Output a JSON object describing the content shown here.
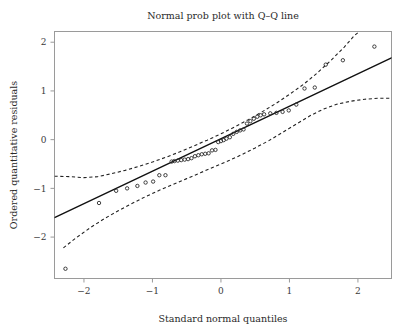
{
  "chart_data": {
    "type": "scatter",
    "title": "Normal prob plot with Q–Q line",
    "xlabel": "Standard normal quantiles",
    "ylabel": "Ordered quantitative residuals",
    "xlim": [
      -2.43,
      2.49
    ],
    "ylim": [
      -2.85,
      2.22
    ],
    "xticks": [
      -2,
      -1,
      0,
      1,
      2
    ],
    "xticklabels": [
      "−2",
      "−1",
      "0",
      "1",
      "2"
    ],
    "yticks": [
      2,
      1,
      0,
      -1,
      -2
    ],
    "yticklabels": [
      "2",
      "1",
      "0",
      "−1",
      "−2"
    ],
    "grid": false,
    "legend": false,
    "marker": "open-circle",
    "marker_size_px": 3.4,
    "series": [
      {
        "name": "Ordered residuals vs normal quantiles",
        "type": "scatter",
        "points": [
          [
            -2.27,
            -2.65
          ],
          [
            -1.78,
            -1.3
          ],
          [
            -1.53,
            -1.05
          ],
          [
            -1.37,
            -1.0
          ],
          [
            -1.22,
            -0.95
          ],
          [
            -1.1,
            -0.88
          ],
          [
            -0.99,
            -0.86
          ],
          [
            -0.9,
            -0.73
          ],
          [
            -0.81,
            -0.73
          ],
          [
            -0.72,
            -0.45
          ],
          [
            -0.68,
            -0.44
          ],
          [
            -0.63,
            -0.43
          ],
          [
            -0.58,
            -0.42
          ],
          [
            -0.53,
            -0.41
          ],
          [
            -0.48,
            -0.4
          ],
          [
            -0.43,
            -0.38
          ],
          [
            -0.38,
            -0.34
          ],
          [
            -0.33,
            -0.32
          ],
          [
            -0.28,
            -0.3
          ],
          [
            -0.23,
            -0.29
          ],
          [
            -0.18,
            -0.28
          ],
          [
            -0.13,
            -0.22
          ],
          [
            -0.08,
            -0.21
          ],
          [
            -0.04,
            -0.05
          ],
          [
            0.0,
            -0.03
          ],
          [
            0.04,
            -0.01
          ],
          [
            0.08,
            0.02
          ],
          [
            0.13,
            0.05
          ],
          [
            0.18,
            0.12
          ],
          [
            0.23,
            0.16
          ],
          [
            0.28,
            0.19
          ],
          [
            0.33,
            0.21
          ],
          [
            0.38,
            0.33
          ],
          [
            0.43,
            0.38
          ],
          [
            0.48,
            0.43
          ],
          [
            0.53,
            0.47
          ],
          [
            0.58,
            0.5
          ],
          [
            0.63,
            0.52
          ],
          [
            0.72,
            0.54
          ],
          [
            0.81,
            0.55
          ],
          [
            0.9,
            0.57
          ],
          [
            0.99,
            0.6
          ],
          [
            1.1,
            0.72
          ],
          [
            1.22,
            1.05
          ],
          [
            1.37,
            1.07
          ],
          [
            1.53,
            1.54
          ],
          [
            1.78,
            1.63
          ],
          [
            2.24,
            1.91
          ]
        ]
      },
      {
        "name": "Q–Q reference line",
        "type": "line",
        "style": "solid",
        "endpoints": [
          [
            -2.43,
            -1.6
          ],
          [
            2.49,
            1.68
          ]
        ]
      },
      {
        "name": "Upper confidence band",
        "type": "line",
        "style": "dashed",
        "points": [
          [
            -2.43,
            -0.75
          ],
          [
            -2.2,
            -0.76
          ],
          [
            -2.0,
            -0.78
          ],
          [
            -1.8,
            -0.76
          ],
          [
            -1.6,
            -0.7
          ],
          [
            -1.4,
            -0.63
          ],
          [
            -1.2,
            -0.55
          ],
          [
            -1.0,
            -0.46
          ],
          [
            -0.8,
            -0.36
          ],
          [
            -0.6,
            -0.25
          ],
          [
            -0.4,
            -0.13
          ],
          [
            -0.2,
            -0.01
          ],
          [
            0.0,
            0.12
          ],
          [
            0.2,
            0.26
          ],
          [
            0.4,
            0.41
          ],
          [
            0.6,
            0.57
          ],
          [
            0.8,
            0.74
          ],
          [
            1.0,
            0.93
          ],
          [
            1.2,
            1.13
          ],
          [
            1.4,
            1.36
          ],
          [
            1.6,
            1.62
          ],
          [
            1.8,
            1.9
          ],
          [
            1.95,
            2.14
          ],
          [
            2.02,
            2.22
          ]
        ]
      },
      {
        "name": "Lower confidence band",
        "type": "line",
        "style": "dashed",
        "points": [
          [
            -2.3,
            -2.22
          ],
          [
            -2.1,
            -2.0
          ],
          [
            -1.9,
            -1.8
          ],
          [
            -1.7,
            -1.62
          ],
          [
            -1.5,
            -1.46
          ],
          [
            -1.3,
            -1.31
          ],
          [
            -1.1,
            -1.17
          ],
          [
            -0.9,
            -1.04
          ],
          [
            -0.7,
            -0.92
          ],
          [
            -0.5,
            -0.8
          ],
          [
            -0.3,
            -0.68
          ],
          [
            -0.1,
            -0.56
          ],
          [
            0.1,
            -0.44
          ],
          [
            0.3,
            -0.31
          ],
          [
            0.5,
            -0.17
          ],
          [
            0.7,
            -0.02
          ],
          [
            0.9,
            0.15
          ],
          [
            1.1,
            0.32
          ],
          [
            1.3,
            0.49
          ],
          [
            1.5,
            0.63
          ],
          [
            1.7,
            0.73
          ],
          [
            1.9,
            0.79
          ],
          [
            2.1,
            0.83
          ],
          [
            2.3,
            0.85
          ],
          [
            2.49,
            0.85
          ]
        ]
      }
    ]
  }
}
